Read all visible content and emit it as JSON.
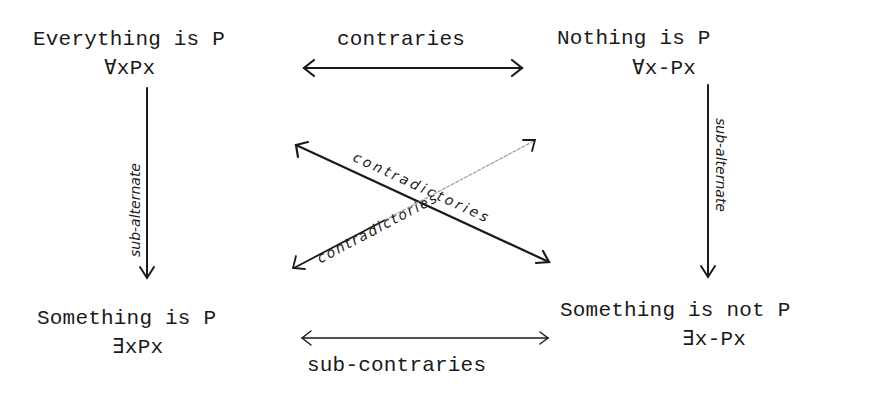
{
  "corners": {
    "top_left": {
      "statement": "Everything is P",
      "formula": "∀xPx"
    },
    "top_right": {
      "statement": "Nothing is P",
      "formula": "∀x-Px"
    },
    "bottom_left": {
      "statement": "Something is P",
      "formula": "∃xPx"
    },
    "bottom_right": {
      "statement": "Something is not P",
      "formula": "∃x-Px"
    }
  },
  "relations": {
    "top": "contraries",
    "bottom": "sub-contraries",
    "left": "sub-alternate",
    "right": "sub-alternate",
    "diagonal_1": "contradictories",
    "diagonal_2": "contradictories"
  },
  "colors": {
    "ink": "#1a1a1a",
    "faint_ink": "#9a9a9a",
    "background": "#ffffff"
  }
}
